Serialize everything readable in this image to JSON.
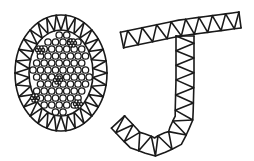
{
  "illustration": {
    "description": "Line-art letters O and J drawn as cell/petal patterns",
    "letters": [
      "O",
      "J"
    ],
    "colors": {
      "line": "#1a1a1a",
      "background": "#ffffff"
    }
  }
}
